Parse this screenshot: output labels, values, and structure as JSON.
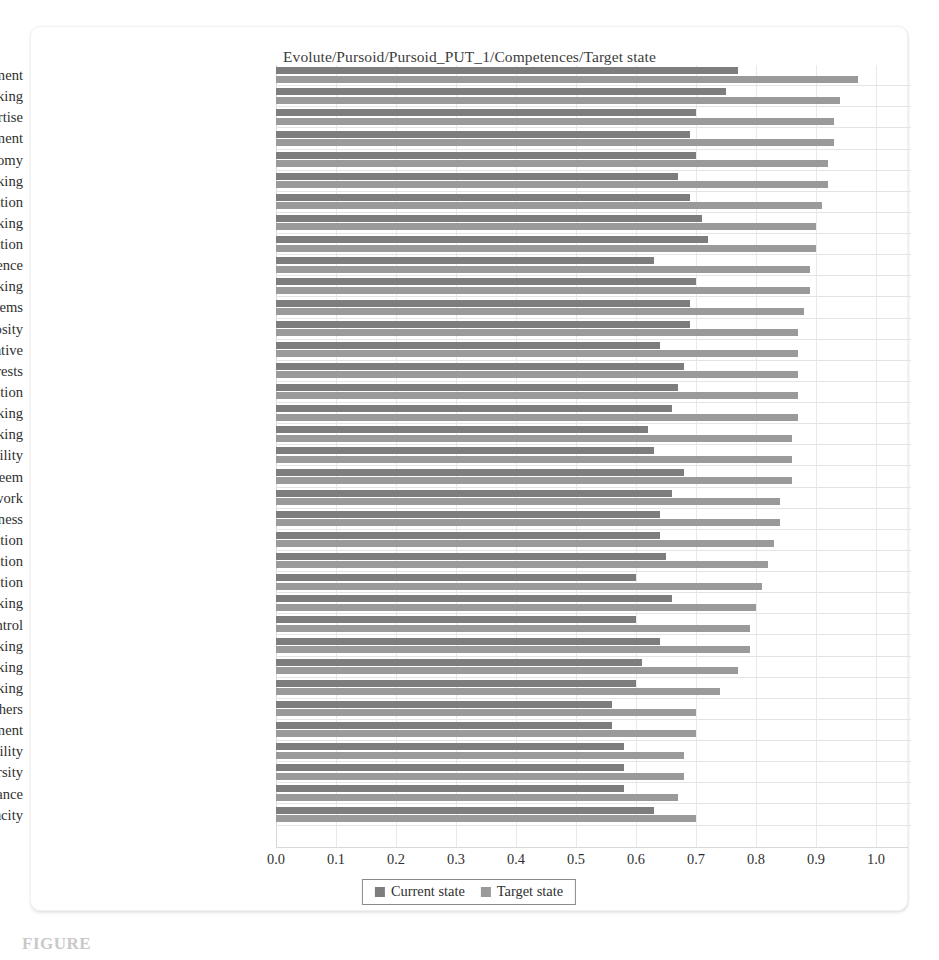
{
  "chart_data": {
    "type": "bar",
    "orientation": "horizontal",
    "title": "Evolute/Pursoid/Pursoid_PUT_1/Competences/Target state",
    "xlabel": "",
    "ylabel": "",
    "xlim": [
      0.0,
      1.0
    ],
    "grid": true,
    "legend_position": "bottom-center",
    "tick_labels": [
      "0.0",
      "0.1",
      "0.2",
      "0.3",
      "0.4",
      "0.5",
      "0.6",
      "0.7",
      "0.8",
      "0.9",
      "1.0"
    ],
    "tick_values": [
      0.0,
      0.1,
      0.2,
      0.3,
      0.4,
      0.5,
      0.6,
      0.7,
      0.8,
      0.9,
      1.0
    ],
    "categories": [
      "Self-development",
      "Networking",
      "Occupational and technical expertise",
      "Change management",
      "Autonomy",
      "Critical thinking",
      "Communication",
      "Strategic thinking",
      "Achievement orientation",
      "Self-confidence",
      "Risk taking",
      "Formulating problems",
      "Curiosity",
      "Initiative",
      "Focus and interests",
      "Imagination",
      "Lateral thinking",
      "Analytical thinking",
      "Flexibility",
      "Self-esteem",
      "Attitude to my work",
      "Trustworthiness",
      "Seeking information",
      "Teamwork and cooperation",
      "Observation",
      "Intuitive thinking",
      "Self-control",
      "Creative thinking",
      "Divergent thinking",
      "Convergent thinking",
      "Understanding others",
      "Conflict management",
      "Responsibility",
      "Leveraging diversity",
      "Stress tolerance",
      "Absorptive capacity"
    ],
    "series": [
      {
        "name": "Current state",
        "color": "#7d7d7d",
        "values": [
          0.77,
          0.75,
          0.7,
          0.69,
          0.7,
          0.67,
          0.69,
          0.71,
          0.72,
          0.63,
          0.7,
          0.69,
          0.69,
          0.64,
          0.68,
          0.67,
          0.66,
          0.62,
          0.63,
          0.68,
          0.66,
          0.64,
          0.64,
          0.65,
          0.6,
          0.66,
          0.6,
          0.64,
          0.61,
          0.6,
          0.56,
          0.56,
          0.58,
          0.58,
          0.58,
          0.63
        ]
      },
      {
        "name": "Target state",
        "color": "#9a9a9a",
        "values": [
          0.97,
          0.94,
          0.93,
          0.93,
          0.92,
          0.92,
          0.91,
          0.9,
          0.9,
          0.89,
          0.89,
          0.88,
          0.87,
          0.87,
          0.87,
          0.87,
          0.87,
          0.86,
          0.86,
          0.86,
          0.84,
          0.84,
          0.83,
          0.82,
          0.81,
          0.8,
          0.79,
          0.79,
          0.77,
          0.74,
          0.7,
          0.7,
          0.68,
          0.68,
          0.67,
          0.7
        ]
      }
    ]
  },
  "legend": {
    "items": [
      {
        "label": "Current state",
        "color": "#7d7d7d"
      },
      {
        "label": "Target state",
        "color": "#9a9a9a"
      }
    ]
  },
  "caption": {
    "text": "FIGURE"
  }
}
